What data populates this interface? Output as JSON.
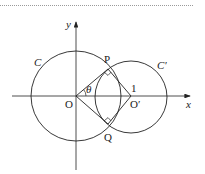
{
  "diagram": {
    "type": "geometry",
    "axes": {
      "x_label": "x",
      "y_label": "y"
    },
    "points": {
      "O": "O",
      "O_prime": "O′",
      "P": "P",
      "Q": "Q"
    },
    "circles": {
      "C": "C",
      "C_prime": "C′"
    },
    "angle_label": "θ",
    "distance_label": "1",
    "right_angles": [
      "P",
      "Q"
    ],
    "colors": {
      "stroke": "#222222",
      "rule": "#9a9a9a"
    }
  }
}
